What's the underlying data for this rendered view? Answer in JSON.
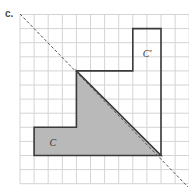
{
  "part_label": "c.",
  "grid": {
    "origin_x": 20,
    "origin_y": 14.5,
    "cell": 14.1,
    "cols": 12,
    "rows": 12,
    "line_color": "#d4d4d4"
  },
  "shapes": {
    "preimage": {
      "label": "C",
      "fill": "#b9b9b9",
      "stroke": "#3a3a3a",
      "vertices_grid": [
        [
          1,
          8
        ],
        [
          4,
          8
        ],
        [
          4,
          4
        ],
        [
          10,
          10
        ],
        [
          1,
          10
        ]
      ]
    },
    "image": {
      "label": "C'",
      "fill": "none",
      "stroke": "#3a3a3a",
      "vertices_grid": [
        [
          4,
          4
        ],
        [
          8,
          4
        ],
        [
          8,
          1
        ],
        [
          10,
          1
        ],
        [
          10,
          10
        ]
      ]
    }
  },
  "reflection_line": {
    "style": "dashed",
    "color": "#555555",
    "from": [
      20,
      14
    ],
    "to": [
      188,
      187
    ]
  },
  "labels": {
    "preimage_text": "C",
    "image_text": "C'"
  }
}
